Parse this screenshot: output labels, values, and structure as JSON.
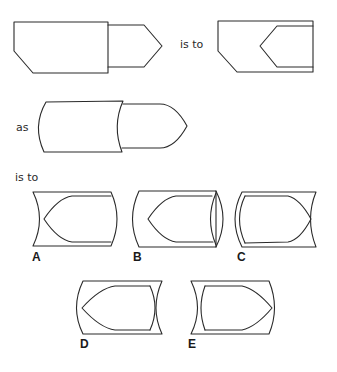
{
  "puzzle": {
    "type": "visual-analogy",
    "connector_1": "is to",
    "connector_2": "as",
    "connector_3": "is to",
    "stroke_color": "#2a2a2a",
    "background": "#ffffff"
  },
  "options": [
    {
      "label": "A"
    },
    {
      "label": "B"
    },
    {
      "label": "C"
    },
    {
      "label": "D"
    },
    {
      "label": "E"
    }
  ]
}
